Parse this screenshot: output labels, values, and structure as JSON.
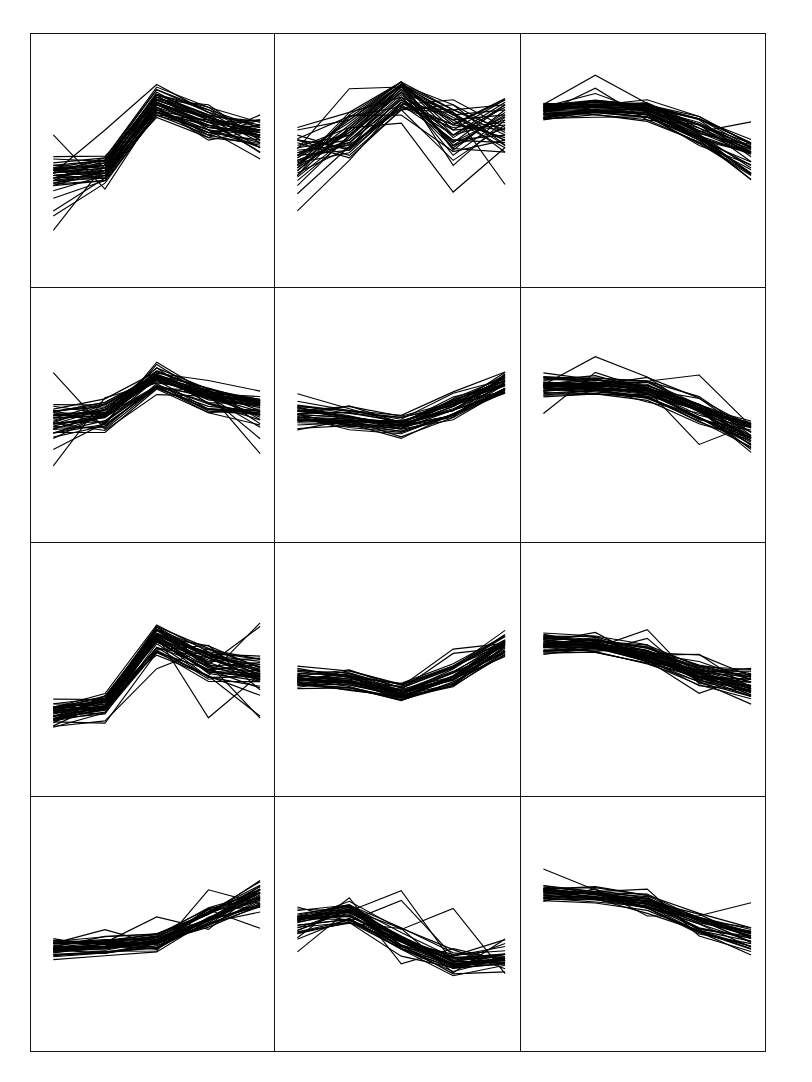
{
  "figure": {
    "title": "",
    "width": 812,
    "height": 1082,
    "background": "#ffffff",
    "border_color": "#141414",
    "line_color": "#000000",
    "rows": 4,
    "cols": 3
  },
  "chart_data": {
    "type": "line",
    "subtype": "parallel-coordinates-small-multiples",
    "title": "",
    "xlabel": "",
    "ylabel": "",
    "x": [
      1,
      2,
      3,
      4,
      5
    ],
    "xlim": [
      1,
      5
    ],
    "ylim": [
      0,
      1
    ],
    "grid": false,
    "legend": null,
    "axis_ticks_visible": false,
    "panel_layout": {
      "rows": 4,
      "cols": 3,
      "order": "row-major"
    },
    "panels": [
      {
        "id": "panel-r1c1",
        "row": 1,
        "col": 1,
        "label": "",
        "n_lines": 34,
        "profile_shape": "rise-then-fall",
        "mean_profile": [
          0.44,
          0.46,
          0.72,
          0.66,
          0.6
        ],
        "series": [
          {
            "name": "s1",
            "values": [
              0.46,
              0.48,
              0.74,
              0.66,
              0.62
            ]
          },
          {
            "name": "s2",
            "values": [
              0.44,
              0.45,
              0.72,
              0.63,
              0.6
            ]
          },
          {
            "name": "s3",
            "values": [
              0.48,
              0.5,
              0.78,
              0.7,
              0.63
            ]
          },
          {
            "name": "s4",
            "values": [
              0.42,
              0.43,
              0.69,
              0.61,
              0.58
            ]
          },
          {
            "name": "s5",
            "values": [
              0.45,
              0.47,
              0.75,
              0.67,
              0.61
            ]
          },
          {
            "name": "s6",
            "values": [
              0.47,
              0.46,
              0.71,
              0.64,
              0.59
            ]
          },
          {
            "name": "s7",
            "values": [
              0.43,
              0.49,
              0.76,
              0.68,
              0.64
            ]
          },
          {
            "name": "s8",
            "values": [
              0.41,
              0.44,
              0.7,
              0.62,
              0.57
            ]
          },
          {
            "name": "s9",
            "values": [
              0.49,
              0.51,
              0.79,
              0.71,
              0.65
            ]
          },
          {
            "name": "s10",
            "values": [
              0.4,
              0.42,
              0.68,
              0.6,
              0.56
            ]
          },
          {
            "name": "s11",
            "values": [
              0.45,
              0.62,
              0.8,
              0.69,
              0.63
            ]
          },
          {
            "name": "s12",
            "values": [
              0.44,
              0.46,
              0.73,
              0.65,
              0.66
            ]
          },
          {
            "name": "s13",
            "values": [
              0.46,
              0.45,
              0.72,
              0.67,
              0.55
            ]
          },
          {
            "name": "s14",
            "values": [
              0.28,
              0.41,
              0.69,
              0.64,
              0.6
            ]
          },
          {
            "name": "s15",
            "values": [
              0.3,
              0.43,
              0.71,
              0.58,
              0.62
            ]
          },
          {
            "name": "s16",
            "values": [
              0.43,
              0.47,
              0.74,
              0.72,
              0.58
            ]
          },
          {
            "name": "s17",
            "values": [
              0.47,
              0.44,
              0.7,
              0.61,
              0.64
            ]
          },
          {
            "name": "s18",
            "values": [
              0.45,
              0.48,
              0.77,
              0.66,
              0.53
            ]
          },
          {
            "name": "s19",
            "values": [
              0.38,
              0.44,
              0.73,
              0.63,
              0.61
            ]
          },
          {
            "name": "s20",
            "values": [
              0.42,
              0.5,
              0.76,
              0.7,
              0.59
            ]
          },
          {
            "name": "s21",
            "values": [
              0.44,
              0.45,
              0.67,
              0.59,
              0.68
            ]
          },
          {
            "name": "s22",
            "values": [
              0.46,
              0.49,
              0.75,
              0.68,
              0.57
            ]
          },
          {
            "name": "s23",
            "values": [
              0.4,
              0.46,
              0.72,
              0.65,
              0.63
            ]
          },
          {
            "name": "s24",
            "values": [
              0.48,
              0.47,
              0.7,
              0.62,
              0.6
            ]
          },
          {
            "name": "s25",
            "values": [
              0.35,
              0.42,
              0.68,
              0.66,
              0.62
            ]
          },
          {
            "name": "s26",
            "values": [
              0.45,
              0.51,
              0.78,
              0.69,
              0.58
            ]
          },
          {
            "name": "s27",
            "values": [
              0.43,
              0.44,
              0.71,
              0.6,
              0.66
            ]
          },
          {
            "name": "s28",
            "values": [
              0.47,
              0.48,
              0.74,
              0.67,
              0.61
            ]
          },
          {
            "name": "s29",
            "values": [
              0.41,
              0.46,
              0.73,
              0.64,
              0.55
            ]
          },
          {
            "name": "s30",
            "values": [
              0.44,
              0.43,
              0.69,
              0.61,
              0.64
            ]
          },
          {
            "name": "s31",
            "values": [
              0.46,
              0.5,
              0.76,
              0.71,
              0.59
            ]
          },
          {
            "name": "s32",
            "values": [
              0.42,
              0.45,
              0.72,
              0.63,
              0.62
            ]
          },
          {
            "name": "s33",
            "values": [
              0.45,
              0.47,
              0.75,
              0.66,
              0.6
            ]
          },
          {
            "name": "s34",
            "values": [
              0.44,
              0.46,
              0.73,
              0.65,
              0.61
            ]
          }
        ]
      },
      {
        "id": "panel-r1c2",
        "row": 1,
        "col": 2,
        "label": "",
        "n_lines": 30,
        "profile_shape": "diffuse-peak-center",
        "mean_profile": [
          0.52,
          0.6,
          0.72,
          0.62,
          0.62
        ],
        "series": [
          {
            "name": "s1",
            "values": [
              0.55,
              0.63,
              0.8,
              0.7,
              0.72
            ]
          },
          {
            "name": "s2",
            "values": [
              0.5,
              0.58,
              0.76,
              0.6,
              0.66
            ]
          },
          {
            "name": "s3",
            "values": [
              0.62,
              0.66,
              0.8,
              0.64,
              0.74
            ]
          },
          {
            "name": "s4",
            "values": [
              0.45,
              0.55,
              0.72,
              0.58,
              0.6
            ]
          },
          {
            "name": "s5",
            "values": [
              0.52,
              0.61,
              0.79,
              0.66,
              0.68
            ]
          },
          {
            "name": "s6",
            "values": [
              0.58,
              0.52,
              0.7,
              0.72,
              0.56
            ]
          },
          {
            "name": "s7",
            "values": [
              0.44,
              0.68,
              0.81,
              0.54,
              0.7
            ]
          },
          {
            "name": "s8",
            "values": [
              0.53,
              0.57,
              0.74,
              0.62,
              0.64
            ]
          },
          {
            "name": "s9",
            "values": [
              0.48,
              0.64,
              0.8,
              0.68,
              0.58
            ]
          },
          {
            "name": "s10",
            "values": [
              0.56,
              0.6,
              0.77,
              0.57,
              0.72
            ]
          },
          {
            "name": "s11",
            "values": [
              0.3,
              0.5,
              0.73,
              0.64,
              0.62
            ]
          },
          {
            "name": "s12",
            "values": [
              0.51,
              0.62,
              0.8,
              0.48,
              0.66
            ]
          },
          {
            "name": "s13",
            "values": [
              0.54,
              0.56,
              0.71,
              0.7,
              0.6
            ]
          },
          {
            "name": "s14",
            "values": [
              0.47,
              0.67,
              0.81,
              0.6,
              0.73
            ]
          },
          {
            "name": "s15",
            "values": [
              0.6,
              0.54,
              0.75,
              0.66,
              0.55
            ]
          },
          {
            "name": "s16",
            "values": [
              0.42,
              0.59,
              0.78,
              0.56,
              0.68
            ]
          },
          {
            "name": "s17",
            "values": [
              0.52,
              0.65,
              0.8,
              0.72,
              0.61
            ]
          },
          {
            "name": "s18",
            "values": [
              0.57,
              0.51,
              0.7,
              0.5,
              0.64
            ]
          },
          {
            "name": "s19",
            "values": [
              0.46,
              0.62,
              0.79,
              0.68,
              0.7
            ]
          },
          {
            "name": "s20",
            "values": [
              0.5,
              0.57,
              0.74,
              0.58,
              0.57
            ]
          },
          {
            "name": "s21",
            "values": [
              0.63,
              0.69,
              0.81,
              0.62,
              0.74
            ]
          },
          {
            "name": "s22",
            "values": [
              0.49,
              0.53,
              0.72,
              0.74,
              0.63
            ]
          },
          {
            "name": "s23",
            "values": [
              0.53,
              0.6,
              0.77,
              0.52,
              0.67
            ]
          },
          {
            "name": "s24",
            "values": [
              0.44,
              0.63,
              0.8,
              0.65,
              0.59
            ]
          },
          {
            "name": "s25",
            "values": [
              0.58,
              0.55,
              0.73,
              0.6,
              0.71
            ]
          },
          {
            "name": "s26",
            "values": [
              0.51,
              0.66,
              0.81,
              0.7,
              0.62
            ]
          },
          {
            "name": "s27",
            "values": [
              0.55,
              0.58,
              0.75,
              0.55,
              0.69
            ]
          },
          {
            "name": "s28",
            "values": [
              0.47,
              0.61,
              0.78,
              0.67,
              0.58
            ]
          },
          {
            "name": "s29",
            "values": [
              0.52,
              0.54,
              0.71,
              0.63,
              0.65
            ]
          },
          {
            "name": "s30",
            "values": [
              0.4,
              0.6,
              0.79,
              0.59,
              0.72
            ]
          }
        ]
      },
      {
        "id": "panel-r1c3",
        "row": 1,
        "col": 3,
        "label": "",
        "n_lines": 32,
        "profile_shape": "flat-then-drop",
        "mean_profile": [
          0.7,
          0.71,
          0.7,
          0.62,
          0.52
        ]
      },
      {
        "id": "panel-r2c1",
        "row": 2,
        "col": 1,
        "label": "",
        "n_lines": 33,
        "profile_shape": "rise-then-fall",
        "mean_profile": [
          0.47,
          0.5,
          0.64,
          0.56,
          0.52
        ]
      },
      {
        "id": "panel-r2c2",
        "row": 2,
        "col": 2,
        "label": "",
        "n_lines": 30,
        "profile_shape": "dip-then-rise",
        "mean_profile": [
          0.5,
          0.49,
          0.46,
          0.53,
          0.62
        ]
      },
      {
        "id": "panel-r2c3",
        "row": 2,
        "col": 3,
        "label": "",
        "n_lines": 32,
        "profile_shape": "flat-then-drop",
        "mean_profile": [
          0.62,
          0.62,
          0.6,
          0.52,
          0.42
        ]
      },
      {
        "id": "panel-r3c1",
        "row": 3,
        "col": 1,
        "label": "",
        "n_lines": 34,
        "profile_shape": "flat-then-sharp-peak",
        "mean_profile": [
          0.33,
          0.36,
          0.62,
          0.52,
          0.48
        ]
      },
      {
        "id": "panel-r3c2",
        "row": 3,
        "col": 2,
        "label": "",
        "n_lines": 30,
        "profile_shape": "dip-then-rise",
        "mean_profile": [
          0.47,
          0.46,
          0.41,
          0.48,
          0.6
        ]
      },
      {
        "id": "panel-r3c3",
        "row": 3,
        "col": 3,
        "label": "",
        "n_lines": 32,
        "profile_shape": "flat-then-decline",
        "mean_profile": [
          0.6,
          0.6,
          0.56,
          0.49,
          0.44
        ]
      },
      {
        "id": "panel-r4c1",
        "row": 4,
        "col": 1,
        "label": "",
        "n_lines": 30,
        "profile_shape": "flat-then-rise",
        "mean_profile": [
          0.4,
          0.41,
          0.43,
          0.52,
          0.61
        ]
      },
      {
        "id": "panel-r4c2",
        "row": 4,
        "col": 2,
        "label": "",
        "n_lines": 28,
        "profile_shape": "peak-then-dip",
        "mean_profile": [
          0.5,
          0.54,
          0.42,
          0.34,
          0.36
        ]
      },
      {
        "id": "panel-r4c3",
        "row": 4,
        "col": 3,
        "label": "",
        "n_lines": 26,
        "profile_shape": "flat-then-decline",
        "mean_profile": [
          0.62,
          0.61,
          0.58,
          0.5,
          0.44
        ]
      }
    ]
  }
}
